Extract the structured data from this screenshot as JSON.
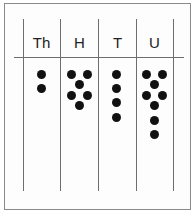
{
  "diagram": {
    "type": "place-value-chart",
    "number_represented": "2648",
    "columns": [
      {
        "label": "Th",
        "dots": 2,
        "dot_positions": [
          [
            41,
            74
          ],
          [
            41,
            88
          ]
        ]
      },
      {
        "label": "H",
        "dots": 6,
        "dot_positions": [
          [
            71,
            74
          ],
          [
            87,
            74
          ],
          [
            79,
            84
          ],
          [
            71,
            95
          ],
          [
            87,
            95
          ],
          [
            79,
            105
          ]
        ]
      },
      {
        "label": "T",
        "dots": 4,
        "dot_positions": [
          [
            116,
            74
          ],
          [
            116,
            88
          ],
          [
            116,
            102
          ],
          [
            116,
            117
          ]
        ]
      },
      {
        "label": "U",
        "dots": 8,
        "dot_positions": [
          [
            146,
            74
          ],
          [
            162,
            74
          ],
          [
            154,
            84
          ],
          [
            146,
            95
          ],
          [
            162,
            95
          ],
          [
            154,
            105
          ],
          [
            154,
            120
          ],
          [
            154,
            134
          ]
        ]
      }
    ],
    "colors": {
      "dot": "#111111",
      "line": "#6e6e6e",
      "frame": "#8a8a8a"
    }
  }
}
